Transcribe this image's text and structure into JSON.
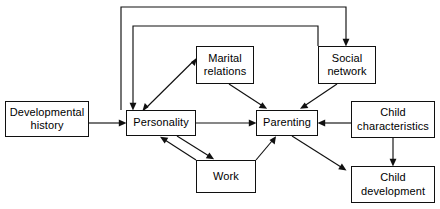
{
  "diagram": {
    "type": "flow-diagram",
    "canvas": {
      "width": 440,
      "height": 209
    },
    "style": {
      "box_fill": "#ffffff",
      "box_border": "#101010",
      "line_color": "#101010",
      "text_color": "#000000",
      "background": "#ffffff"
    },
    "nodes": [
      {
        "id": "developmental-history",
        "label": "Developmental\nhistory",
        "x": 5,
        "y": 101,
        "w": 84,
        "h": 36
      },
      {
        "id": "personality",
        "label": "Personality",
        "x": 126,
        "y": 110,
        "w": 70,
        "h": 26
      },
      {
        "id": "marital-relations",
        "label": "Marital\nrelations",
        "x": 196,
        "y": 46,
        "w": 58,
        "h": 38
      },
      {
        "id": "social-network",
        "label": "Social\nnetwork",
        "x": 318,
        "y": 46,
        "w": 58,
        "h": 38
      },
      {
        "id": "parenting",
        "label": "Parenting",
        "x": 256,
        "y": 110,
        "w": 62,
        "h": 26
      },
      {
        "id": "work",
        "label": "Work",
        "x": 196,
        "y": 160,
        "w": 60,
        "h": 33
      },
      {
        "id": "child-characteristics",
        "label": "Child\ncharacteristics",
        "x": 351,
        "y": 101,
        "w": 84,
        "h": 37
      },
      {
        "id": "child-development",
        "label": "Child\ndevelopment",
        "x": 351,
        "y": 166,
        "w": 84,
        "h": 37
      }
    ],
    "edges": [
      {
        "id": "dev-history-to-personality",
        "from": "developmental-history",
        "to": "personality",
        "arrow": "single"
      },
      {
        "id": "personality-to-marital-relations",
        "from": "personality",
        "to": "marital-relations",
        "arrow": "double"
      },
      {
        "id": "marital-relations-to-parenting",
        "from": "marital-relations",
        "to": "parenting",
        "arrow": "single"
      },
      {
        "id": "social-network-to-parenting",
        "from": "social-network",
        "to": "parenting",
        "arrow": "single"
      },
      {
        "id": "personality-to-parenting",
        "from": "personality",
        "to": "parenting",
        "arrow": "single"
      },
      {
        "id": "personality-to-work",
        "from": "personality",
        "to": "work",
        "arrow": "single"
      },
      {
        "id": "work-to-personality",
        "from": "work",
        "to": "personality",
        "arrow": "single"
      },
      {
        "id": "work-to-parenting",
        "from": "work",
        "to": "parenting",
        "arrow": "single"
      },
      {
        "id": "child-characteristics-to-parenting",
        "from": "child-characteristics",
        "to": "parenting",
        "arrow": "single"
      },
      {
        "id": "child-characteristics-to-child-development",
        "from": "child-characteristics",
        "to": "child-development",
        "arrow": "single"
      },
      {
        "id": "parenting-to-child-development",
        "from": "parenting",
        "to": "child-development",
        "arrow": "single"
      },
      {
        "id": "feedback-outer-to-social-network",
        "from": "personality",
        "to": "social-network",
        "arrow": "single",
        "routing": "orthogonal-top"
      },
      {
        "id": "feedback-inner-to-personality",
        "from": "social-network",
        "to": "personality",
        "arrow": "single",
        "routing": "orthogonal-top"
      }
    ]
  }
}
